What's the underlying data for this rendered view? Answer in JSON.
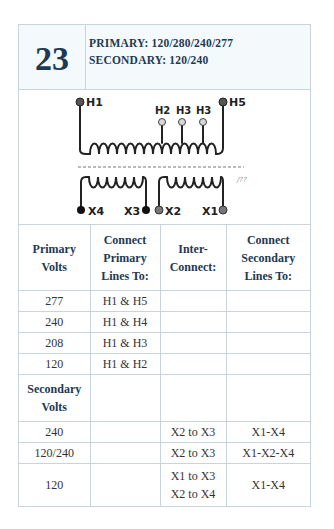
{
  "header": {
    "number": "23",
    "primary": "PRIMARY:  120/280/240/277",
    "secondary": "SECONDARY:  120/240"
  },
  "diagram": {
    "primary_terminals": [
      "H1",
      "H2",
      "H3",
      "H3",
      "H5"
    ],
    "secondary_terminals": [
      "X4",
      "X3",
      "X2",
      "X1"
    ],
    "labels": {
      "h1": "H1",
      "h2": "H2",
      "h3a": "H3",
      "h3b": "H3",
      "h5": "H5",
      "x4": "X4",
      "x3": "X3",
      "x2": "X2",
      "x1": "X1"
    },
    "colors": {
      "terminal_dark": "#555555",
      "terminal_light": "#d0d0d0",
      "terminal_black": "#111111",
      "wire": "#222222"
    }
  },
  "table": {
    "columns": [
      "Primary Volts",
      "Connect Primary Lines To:",
      "Inter-Connect:",
      "Connect Secondary Lines To:"
    ],
    "col_lines": [
      [
        "Primary",
        "Volts"
      ],
      [
        "Connect",
        "Primary",
        "Lines To:"
      ],
      [
        "Inter-",
        "Connect:"
      ],
      [
        "Connect",
        "Secondary",
        "Lines To:"
      ]
    ],
    "primary_rows": [
      {
        "volts": "277",
        "connect": "H1 & H5",
        "inter": "",
        "secondary": ""
      },
      {
        "volts": "240",
        "connect": "H1 & H4",
        "inter": "",
        "secondary": ""
      },
      {
        "volts": "208",
        "connect": "H1 & H3",
        "inter": "",
        "secondary": ""
      },
      {
        "volts": "120",
        "connect": "H1 & H2",
        "inter": "",
        "secondary": ""
      }
    ],
    "secondary_label": [
      "Secondary",
      "Volts"
    ],
    "secondary_rows": [
      {
        "volts": "240",
        "connect": "",
        "inter": [
          "X2 to X3"
        ],
        "secondary": "X1-X4"
      },
      {
        "volts": "120/240",
        "connect": "",
        "inter": [
          "X2 to X3"
        ],
        "secondary": "X1-X2-X4"
      },
      {
        "volts": "120",
        "connect": "",
        "inter": [
          "X1 to X3",
          "X2 to X4"
        ],
        "secondary": "X1-X4"
      }
    ]
  }
}
